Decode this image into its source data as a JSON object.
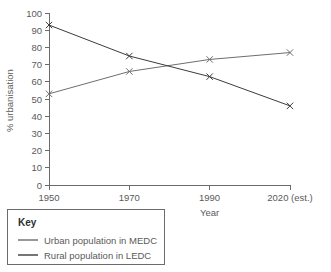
{
  "chart_data": {
    "type": "line",
    "title": "",
    "xlabel": "Year",
    "ylabel": "% urbanisation",
    "x": [
      1950,
      1970,
      1990,
      2020
    ],
    "xtick_labels": [
      "1950",
      "1970",
      "1990",
      "2020 (est.)"
    ],
    "ytick_labels": [
      "0",
      "10",
      "20",
      "30",
      "40",
      "50",
      "60",
      "70",
      "80",
      "90",
      "100"
    ],
    "ytick_values": [
      0,
      10,
      20,
      30,
      40,
      50,
      60,
      70,
      80,
      90,
      100
    ],
    "ylim": [
      0,
      100
    ],
    "grid": false,
    "legend_position": "below-left",
    "marker": "x",
    "series": [
      {
        "name": "Urban population in MEDC",
        "values": [
          53,
          66,
          73,
          77
        ],
        "color": "#6e6e6e"
      },
      {
        "name": "Rural population in LEDC",
        "values": [
          93,
          75,
          63,
          46
        ],
        "color": "#3c3c3c"
      }
    ]
  },
  "legend": {
    "title": "Key",
    "entries": [
      {
        "label": "Urban population in MEDC",
        "color": "#6e6e6e"
      },
      {
        "label": "Rural population in LEDC",
        "color": "#3c3c3c"
      }
    ]
  },
  "axes": {
    "x_title": "Year",
    "y_title": "% urbanisation"
  }
}
